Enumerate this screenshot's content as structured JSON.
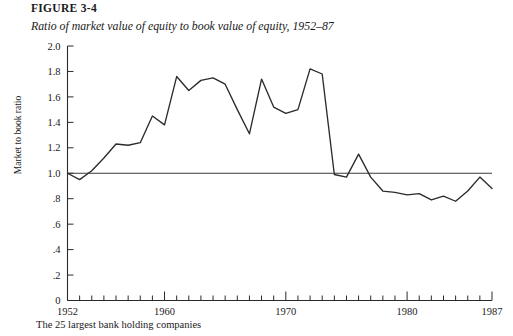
{
  "figure": {
    "label": "FIGURE 3-4",
    "subtitle": "Ratio of market value of equity to book value of equity, 1952–87",
    "footnote": "The 25 largest bank holding companies"
  },
  "chart_data": {
    "type": "line",
    "title": "Ratio of market value of equity to book value of equity, 1952–87",
    "xlabel": "",
    "ylabel": "Market to book ratio",
    "xlim": [
      1952,
      1987
    ],
    "ylim": [
      0,
      2.0
    ],
    "grid": false,
    "legend": null,
    "ytick_labels": [
      "0",
      ".2",
      ".4",
      ".6",
      ".8",
      "1.0",
      "1.2",
      "1.4",
      "1.6",
      "1.8",
      "2.0"
    ],
    "ytick_values": [
      0,
      0.2,
      0.4,
      0.6,
      0.8,
      1.0,
      1.2,
      1.4,
      1.6,
      1.8,
      2.0
    ],
    "xtick_labels": [
      "1952",
      "1960",
      "1970",
      "1980",
      "1987"
    ],
    "xtick_values": [
      1952,
      1960,
      1970,
      1980,
      1987
    ],
    "xtick_all": [
      1952,
      1953,
      1954,
      1955,
      1956,
      1957,
      1958,
      1959,
      1960,
      1961,
      1962,
      1963,
      1964,
      1965,
      1966,
      1967,
      1968,
      1969,
      1970,
      1971,
      1972,
      1973,
      1974,
      1975,
      1976,
      1977,
      1978,
      1979,
      1980,
      1981,
      1982,
      1983,
      1984,
      1985,
      1986,
      1987
    ],
    "reference_line": {
      "y": 1.0,
      "label": "1.0 reference"
    },
    "x": [
      1952,
      1953,
      1954,
      1955,
      1956,
      1957,
      1958,
      1959,
      1960,
      1961,
      1962,
      1963,
      1964,
      1965,
      1966,
      1967,
      1968,
      1969,
      1970,
      1971,
      1972,
      1973,
      1974,
      1975,
      1976,
      1977,
      1978,
      1979,
      1980,
      1981,
      1982,
      1983,
      1984,
      1985,
      1986,
      1987
    ],
    "values": [
      1.0,
      0.95,
      1.02,
      1.12,
      1.23,
      1.22,
      1.24,
      1.45,
      1.38,
      1.76,
      1.65,
      1.73,
      1.75,
      1.7,
      1.5,
      1.31,
      1.74,
      1.52,
      1.47,
      1.5,
      1.82,
      1.78,
      0.99,
      0.97,
      1.15,
      0.97,
      0.86,
      0.85,
      0.83,
      0.84,
      0.79,
      0.82,
      0.78,
      0.86,
      0.97,
      0.88
    ],
    "series_name": "Market to book ratio"
  },
  "colors": {
    "line": "#2b2b2b",
    "axis": "#2a2a2a",
    "reference": "#3a3a3a",
    "background": "#ffffff"
  }
}
